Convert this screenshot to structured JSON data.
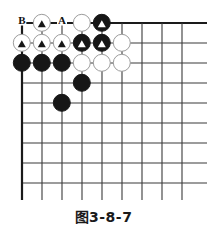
{
  "figure": {
    "caption": "图3-8-7",
    "type": "go-board-diagram"
  },
  "board": {
    "columns": 9,
    "rows": 9,
    "origin_x": 22,
    "origin_y": 23,
    "step": 20,
    "line_color": "#3a3a3a",
    "edge_color": "#1a1a1a",
    "background": "#ffffff",
    "stone_radius": 9.2,
    "black_color": "#161616",
    "white_color": "#ffffff",
    "white_border_color": "#9c9c9c"
  },
  "stones": [
    {
      "col": 2,
      "row": 1,
      "color": "white",
      "mark": "triangle-black"
    },
    {
      "col": 4,
      "row": 1,
      "color": "white",
      "mark": "none"
    },
    {
      "col": 5,
      "row": 1,
      "color": "black",
      "mark": "triangle-white"
    },
    {
      "col": 1,
      "row": 2,
      "color": "white",
      "mark": "triangle-black"
    },
    {
      "col": 2,
      "row": 2,
      "color": "white",
      "mark": "triangle-black"
    },
    {
      "col": 3,
      "row": 2,
      "color": "white",
      "mark": "triangle-black"
    },
    {
      "col": 4,
      "row": 2,
      "color": "black",
      "mark": "triangle-white"
    },
    {
      "col": 5,
      "row": 2,
      "color": "black",
      "mark": "triangle-white"
    },
    {
      "col": 6,
      "row": 2,
      "color": "white",
      "mark": "none"
    },
    {
      "col": 1,
      "row": 3,
      "color": "black",
      "mark": "none"
    },
    {
      "col": 2,
      "row": 3,
      "color": "black",
      "mark": "none"
    },
    {
      "col": 3,
      "row": 3,
      "color": "black",
      "mark": "none"
    },
    {
      "col": 4,
      "row": 3,
      "color": "white",
      "mark": "none"
    },
    {
      "col": 5,
      "row": 3,
      "color": "white",
      "mark": "none"
    },
    {
      "col": 6,
      "row": 3,
      "color": "white",
      "mark": "none"
    },
    {
      "col": 4,
      "row": 4,
      "color": "black",
      "mark": "none"
    },
    {
      "col": 3,
      "row": 5,
      "color": "black",
      "mark": "none"
    }
  ],
  "point_labels": [
    {
      "col": 1,
      "row": 1,
      "text": "B"
    },
    {
      "col": 3,
      "row": 1,
      "text": "A"
    }
  ]
}
